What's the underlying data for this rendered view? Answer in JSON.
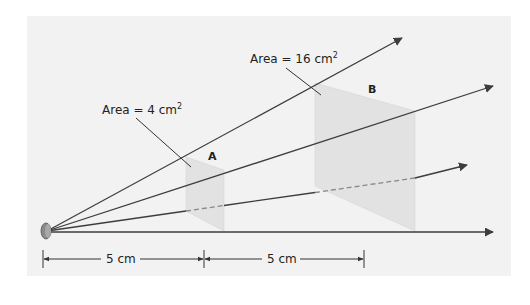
{
  "diagram": {
    "type": "inverse-square-law",
    "colors": {
      "background": "#f2f2f2",
      "ray": "#3d3d3d",
      "panel_fill": "#dcdcdc",
      "dim_line": "#333333",
      "source": "#8a8a8a"
    },
    "labels": {
      "area_a": "Area = 4 cm",
      "area_a_sup": "2",
      "area_b": "Area = 16 cm",
      "area_b_sup": "2",
      "panel_a": "A",
      "panel_b": "B",
      "dist_1": "5 cm",
      "dist_2": "5 cm"
    }
  }
}
